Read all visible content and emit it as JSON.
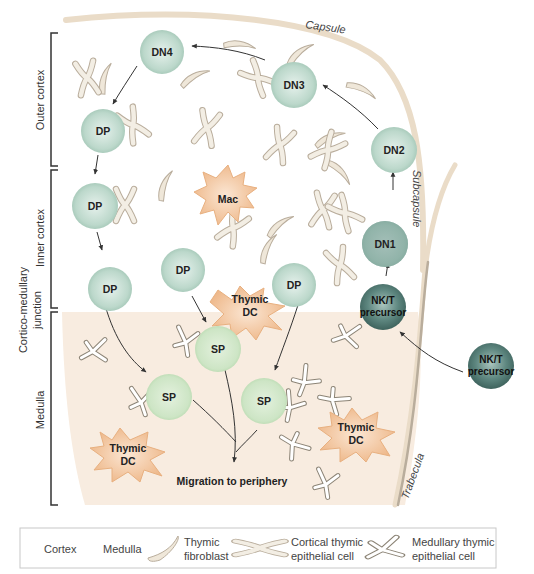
{
  "diagram": {
    "zones": {
      "outer_cortex": "Outer cortex",
      "inner_cortex": "Inner cortex",
      "cortico_medullary_junction_line1": "Cortico-medullary",
      "cortico_medullary_junction_line2": "junction",
      "medulla": "Medulla"
    },
    "structures": {
      "capsule": "Capsule",
      "subcapsule": "Subcapsule",
      "trabecula": "Trabecula"
    },
    "cells": {
      "dn4": "DN4",
      "dn3": "DN3",
      "dn2": "DN2",
      "dn1": "DN1",
      "dp_outer": "DP",
      "dp_inner": "DP",
      "dp_junction_left": "DP",
      "dp_junction_mid": "DP",
      "dp_junction_right": "DP",
      "nkt_precursor_inside_line1": "NK/T",
      "nkt_precursor_inside_line2": "precursor",
      "nkt_precursor_outside_line1": "NK/T",
      "nkt_precursor_outside_line2": "precursor",
      "sp_top": "SP",
      "sp_left": "SP",
      "sp_right": "SP",
      "mac": "Mac",
      "thymic_dc_junction_line1": "Thymic",
      "thymic_dc_junction_line2": "DC",
      "thymic_dc_left_line1": "Thymic",
      "thymic_dc_left_line2": "DC",
      "thymic_dc_right_line1": "Thymic",
      "thymic_dc_right_line2": "DC"
    },
    "migration_label": "Migration to periphery",
    "colors": {
      "medulla_bg": "#f8ece0",
      "capsule": "#eadcc8",
      "trabecula": "#b9ad9c",
      "dn_dp_cell": "#c2dcd0",
      "sp_cell": "#cfe6c8",
      "nkt_cell": "#4f7770",
      "mac_dc": "#f2c49a",
      "epithelial": "#f3eee4"
    }
  },
  "legend": {
    "cortex": "Cortex",
    "medulla": "Medulla",
    "fibroblast_line1": "Thymic",
    "fibroblast_line2": "fibroblast",
    "cortical_line1": "Cortical thymic",
    "cortical_line2": "epithelial cell",
    "medullary_line1": "Medullary thymic",
    "medullary_line2": "epithelial cell"
  }
}
